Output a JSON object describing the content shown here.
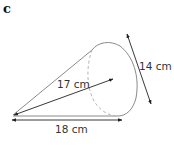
{
  "figure": {
    "part_label": "c",
    "shape": "cone",
    "colors": {
      "outline": "#8a8a8a",
      "dashed": "#b5b5b5",
      "arrow": "#222222",
      "text": "#333333"
    },
    "dimensions": {
      "slant_height": {
        "value": 17,
        "unit": "cm",
        "label": "17 cm"
      },
      "base_diameter": {
        "value": 14,
        "unit": "cm",
        "label": "14 cm"
      },
      "length": {
        "value": 18,
        "unit": "cm",
        "label": "18 cm"
      }
    }
  }
}
